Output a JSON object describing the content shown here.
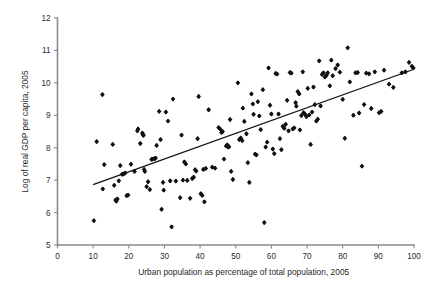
{
  "chart_data": {
    "type": "scatter",
    "title": "",
    "xlabel": "Urban population as percentage of total population, 2005",
    "ylabel": "Log of real  GDP per capita, 2005",
    "xlim": [
      0,
      100
    ],
    "ylim": [
      5,
      12
    ],
    "xticks": [
      0,
      10,
      20,
      30,
      40,
      50,
      60,
      70,
      80,
      90,
      100
    ],
    "yticks": [
      5,
      6,
      7,
      8,
      9,
      10,
      11,
      12
    ],
    "grid": false,
    "legend": null,
    "marker": "diamond",
    "marker_color": "#111111",
    "trendline": {
      "type": "linear",
      "color": "#111111",
      "x": [
        10,
        100
      ],
      "y": [
        6.86,
        10.42
      ]
    },
    "points": [
      [
        10.2,
        5.75
      ],
      [
        11.0,
        8.19
      ],
      [
        12.6,
        9.64
      ],
      [
        12.7,
        6.73
      ],
      [
        13.1,
        7.48
      ],
      [
        15.5,
        8.1
      ],
      [
        15.9,
        6.84
      ],
      [
        16.3,
        6.39
      ],
      [
        16.5,
        6.35
      ],
      [
        16.8,
        6.42
      ],
      [
        17.2,
        6.98
      ],
      [
        17.6,
        7.45
      ],
      [
        18.1,
        7.18
      ],
      [
        18.5,
        7.19
      ],
      [
        19.0,
        7.22
      ],
      [
        19.4,
        6.52
      ],
      [
        19.8,
        6.54
      ],
      [
        20.6,
        7.49
      ],
      [
        21.6,
        7.27
      ],
      [
        22.4,
        8.52
      ],
      [
        22.6,
        8.58
      ],
      [
        23.2,
        8.13
      ],
      [
        23.8,
        8.45
      ],
      [
        24.0,
        8.41
      ],
      [
        24.1,
        8.38
      ],
      [
        24.3,
        7.33
      ],
      [
        24.5,
        7.27
      ],
      [
        25.0,
        6.8
      ],
      [
        25.4,
        6.95
      ],
      [
        25.9,
        6.71
      ],
      [
        26.4,
        7.64
      ],
      [
        26.6,
        7.65
      ],
      [
        27.2,
        7.66
      ],
      [
        27.5,
        7.68
      ],
      [
        27.8,
        8.07
      ],
      [
        28.5,
        9.12
      ],
      [
        28.9,
        8.25
      ],
      [
        29.2,
        6.1
      ],
      [
        29.6,
        6.93
      ],
      [
        29.8,
        6.69
      ],
      [
        30.4,
        9.1
      ],
      [
        31.0,
        8.82
      ],
      [
        31.6,
        6.98
      ],
      [
        32.0,
        5.56
      ],
      [
        32.4,
        9.5
      ],
      [
        33.2,
        6.97
      ],
      [
        34.4,
        6.46
      ],
      [
        34.8,
        8.39
      ],
      [
        35.2,
        7.0
      ],
      [
        35.6,
        7.56
      ],
      [
        36.0,
        7.5
      ],
      [
        36.4,
        6.99
      ],
      [
        37.2,
        6.44
      ],
      [
        37.8,
        7.05
      ],
      [
        38.2,
        7.09
      ],
      [
        38.6,
        7.32
      ],
      [
        38.9,
        7.28
      ],
      [
        39.3,
        8.28
      ],
      [
        39.6,
        9.58
      ],
      [
        40.2,
        6.58
      ],
      [
        40.6,
        6.53
      ],
      [
        40.9,
        7.33
      ],
      [
        41.2,
        6.33
      ],
      [
        41.6,
        7.36
      ],
      [
        42.4,
        9.17
      ],
      [
        43.4,
        7.4
      ],
      [
        44.2,
        7.37
      ],
      [
        45.2,
        8.62
      ],
      [
        45.6,
        8.58
      ],
      [
        46.0,
        8.47
      ],
      [
        46.3,
        8.5
      ],
      [
        46.7,
        7.65
      ],
      [
        47.3,
        8.05
      ],
      [
        47.6,
        8.09
      ],
      [
        47.9,
        8.02
      ],
      [
        48.1,
        8.03
      ],
      [
        48.4,
        8.87
      ],
      [
        48.7,
        7.27
      ],
      [
        49.2,
        7.02
      ],
      [
        50.6,
        10.0
      ],
      [
        51.0,
        8.25
      ],
      [
        51.4,
        8.3
      ],
      [
        51.8,
        8.22
      ],
      [
        52.0,
        9.22
      ],
      [
        52.4,
        8.81
      ],
      [
        53.0,
        8.43
      ],
      [
        53.4,
        7.54
      ],
      [
        53.8,
        6.93
      ],
      [
        54.4,
        9.66
      ],
      [
        54.8,
        9.35
      ],
      [
        55.0,
        9.03
      ],
      [
        55.4,
        7.8
      ],
      [
        55.8,
        7.78
      ],
      [
        56.2,
        9.42
      ],
      [
        56.6,
        8.98
      ],
      [
        57.0,
        8.56
      ],
      [
        57.6,
        9.79
      ],
      [
        58.0,
        5.69
      ],
      [
        58.4,
        8.02
      ],
      [
        58.8,
        8.17
      ],
      [
        59.2,
        10.46
      ],
      [
        59.6,
        9.31
      ],
      [
        60.0,
        9.04
      ],
      [
        60.4,
        7.96
      ],
      [
        60.8,
        7.82
      ],
      [
        61.2,
        10.29
      ],
      [
        61.6,
        10.27
      ],
      [
        62.0,
        9.04
      ],
      [
        62.4,
        8.28
      ],
      [
        62.8,
        7.94
      ],
      [
        63.2,
        8.66
      ],
      [
        63.6,
        8.6
      ],
      [
        64.0,
        8.72
      ],
      [
        64.4,
        9.46
      ],
      [
        64.8,
        8.52
      ],
      [
        65.2,
        10.32
      ],
      [
        65.6,
        10.3
      ],
      [
        66.0,
        8.58
      ],
      [
        66.4,
        8.61
      ],
      [
        66.8,
        9.39
      ],
      [
        67.0,
        9.28
      ],
      [
        67.4,
        9.73
      ],
      [
        67.8,
        9.66
      ],
      [
        68.0,
        8.55
      ],
      [
        68.4,
        8.99
      ],
      [
        68.8,
        10.34
      ],
      [
        69.0,
        9.08
      ],
      [
        69.4,
        9.04
      ],
      [
        69.8,
        8.96
      ],
      [
        70.2,
        9.83
      ],
      [
        70.6,
        9.01
      ],
      [
        71.0,
        8.1
      ],
      [
        71.4,
        9.1
      ],
      [
        71.8,
        9.87
      ],
      [
        72.2,
        9.33
      ],
      [
        72.6,
        8.82
      ],
      [
        73.0,
        8.88
      ],
      [
        73.4,
        10.68
      ],
      [
        73.8,
        9.29
      ],
      [
        74.2,
        10.26
      ],
      [
        74.6,
        10.31
      ],
      [
        75.0,
        10.18
      ],
      [
        75.4,
        10.23
      ],
      [
        75.8,
        10.31
      ],
      [
        76.4,
        9.91
      ],
      [
        76.8,
        10.7
      ],
      [
        77.2,
        10.22
      ],
      [
        78.0,
        10.44
      ],
      [
        78.6,
        10.55
      ],
      [
        79.2,
        10.33
      ],
      [
        80.0,
        9.49
      ],
      [
        80.6,
        8.29
      ],
      [
        81.4,
        11.08
      ],
      [
        82.0,
        10.03
      ],
      [
        83.0,
        9.0
      ],
      [
        83.6,
        10.31
      ],
      [
        84.2,
        10.32
      ],
      [
        84.6,
        9.07
      ],
      [
        85.4,
        7.43
      ],
      [
        86.0,
        9.33
      ],
      [
        86.6,
        10.3
      ],
      [
        87.4,
        10.28
      ],
      [
        88.0,
        9.21
      ],
      [
        89.0,
        10.34
      ],
      [
        90.2,
        9.08
      ],
      [
        90.8,
        9.12
      ],
      [
        91.6,
        10.39
      ],
      [
        93.0,
        9.96
      ],
      [
        94.2,
        9.86
      ],
      [
        96.6,
        10.31
      ],
      [
        97.6,
        10.34
      ],
      [
        98.6,
        10.63
      ],
      [
        99.4,
        10.51
      ],
      [
        99.8,
        10.46
      ]
    ]
  }
}
